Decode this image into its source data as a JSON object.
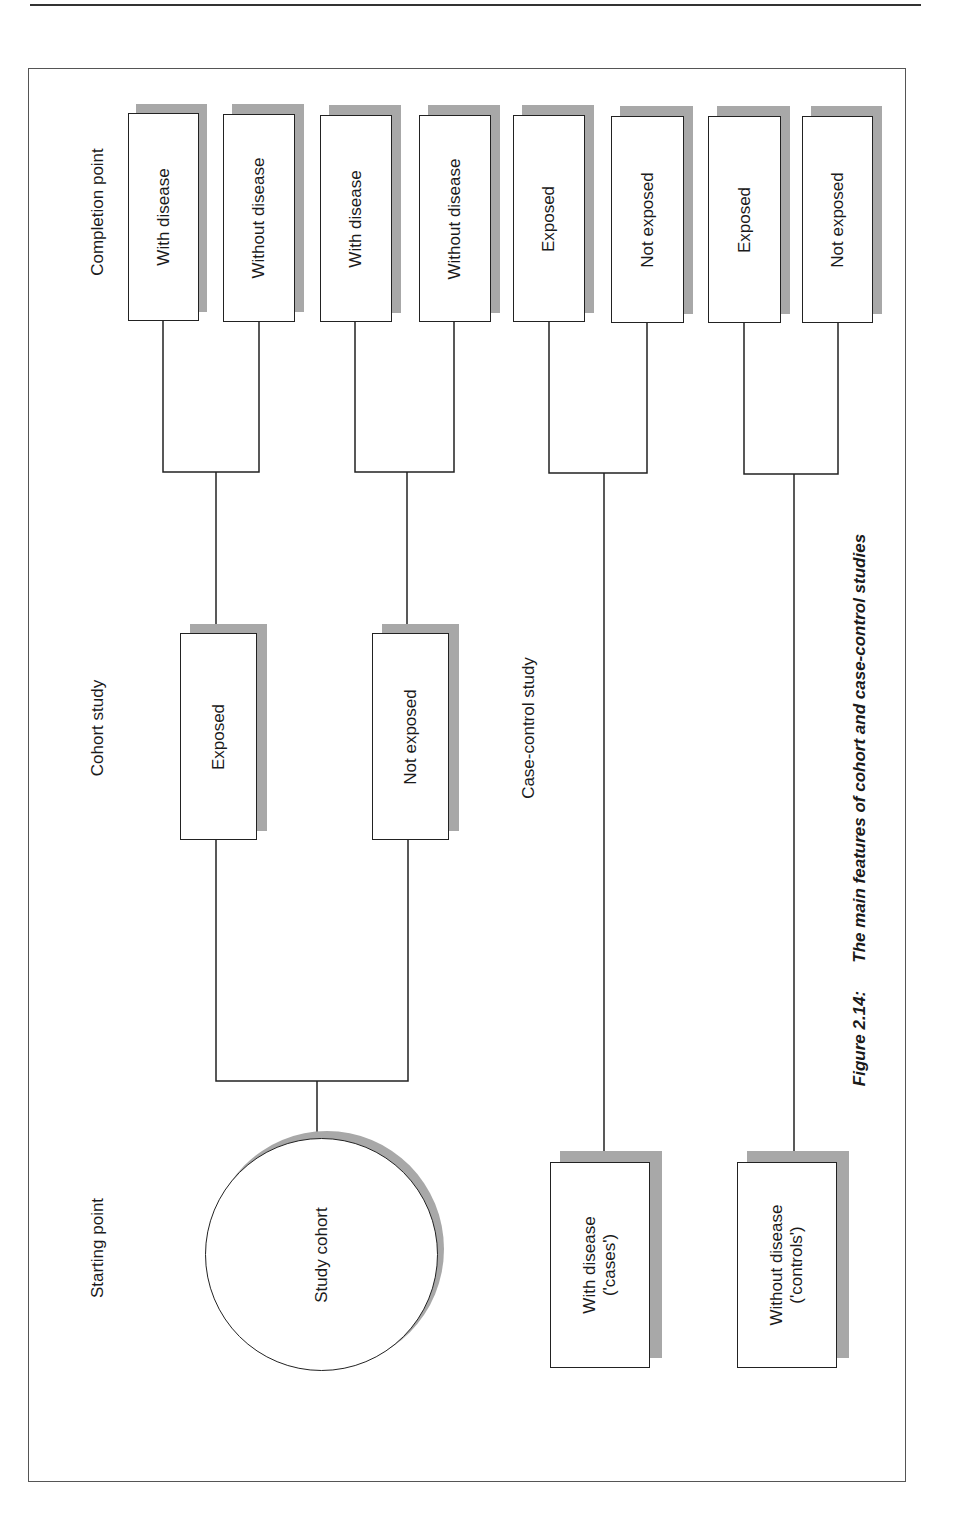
{
  "figure": {
    "number": "Figure 2.14:",
    "title": "The main features of cohort and case-control studies"
  },
  "headings": {
    "completion_point": "Completion point",
    "cohort_study": "Cohort study",
    "case_control_study": "Case-control study",
    "starting_point": "Starting point"
  },
  "start": {
    "study_cohort": "Study cohort"
  },
  "cohort": {
    "groups": [
      {
        "label": "Exposed"
      },
      {
        "label": "Not exposed"
      }
    ]
  },
  "completion": {
    "boxes": [
      {
        "label": "With disease"
      },
      {
        "label": "Without disease"
      },
      {
        "label": "With disease"
      },
      {
        "label": "Without disease"
      },
      {
        "label": "Exposed"
      },
      {
        "label": "Not exposed"
      },
      {
        "label": "Exposed"
      },
      {
        "label": "Not exposed"
      }
    ]
  },
  "case_control": {
    "groups": [
      {
        "line1": "With disease",
        "line2": "('cases')"
      },
      {
        "line1": "Without disease",
        "line2": "('controls')"
      }
    ]
  },
  "colors": {
    "line": "#222222",
    "shadow": "#a8a8a8",
    "background": "#ffffff"
  }
}
